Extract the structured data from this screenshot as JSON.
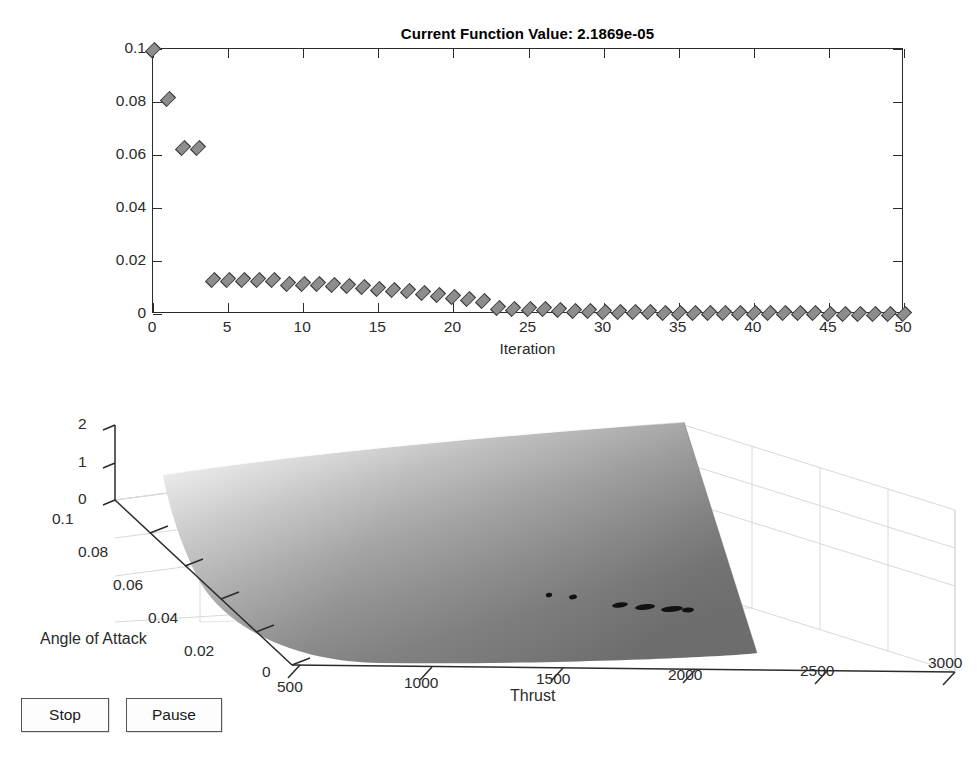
{
  "window": {
    "background": "#ffffff",
    "marker_fill": "#8d8d8d",
    "marker_edge": "#3a3a3a",
    "axis_color": "#2b2b2b"
  },
  "iteration_plot": {
    "title": "Current Function Value: 2.1869e-05",
    "xlabel": "Iteration",
    "ylabel": "Function value",
    "ytick_labels": [
      "0",
      "0.02",
      "0.04",
      "0.06",
      "0.08",
      "0.1"
    ],
    "xtick_labels": [
      "0",
      "5",
      "10",
      "15",
      "20",
      "25",
      "30",
      "35",
      "40",
      "45",
      "50"
    ]
  },
  "surface_plot": {
    "xlabel": "Thrust",
    "ylabel": "Angle of Attack",
    "ztick_labels": [
      "0",
      "1",
      "2"
    ],
    "ytick_labels": [
      "0.1",
      "0.08",
      "0.06",
      "0.04",
      "0.02",
      "0"
    ],
    "xtick_labels": [
      "500",
      "1000",
      "1500",
      "2000",
      "2500",
      "3000"
    ]
  },
  "controls": {
    "stop_label": "Stop",
    "pause_label": "Pause"
  },
  "chart_data": [
    {
      "type": "scatter",
      "title": "Current Function Value: 2.1869e-05",
      "xlabel": "Iteration",
      "ylabel": "Function value",
      "xlim": [
        0,
        50
      ],
      "ylim": [
        0,
        0.1
      ],
      "xticks": [
        0,
        5,
        10,
        15,
        20,
        25,
        30,
        35,
        40,
        45,
        50
      ],
      "yticks": [
        0,
        0.02,
        0.04,
        0.06,
        0.08,
        0.1
      ],
      "grid": false,
      "legend": null,
      "marker": "diamond",
      "series": [
        {
          "name": "Current Function Value",
          "x": [
            0,
            1,
            2,
            3,
            4,
            5,
            6,
            7,
            8,
            9,
            10,
            11,
            12,
            13,
            14,
            15,
            16,
            17,
            18,
            19,
            20,
            21,
            22,
            23,
            24,
            25,
            26,
            27,
            28,
            29,
            30,
            31,
            32,
            33,
            34,
            35,
            36,
            37,
            38,
            39,
            40,
            41,
            42,
            43,
            44,
            45,
            46,
            47,
            48,
            49,
            50
          ],
          "y": [
            0.0995,
            0.081,
            0.0625,
            0.0625,
            0.0128,
            0.0128,
            0.0128,
            0.0127,
            0.0127,
            0.0114,
            0.0113,
            0.0112,
            0.011,
            0.0104,
            0.0103,
            0.0094,
            0.0092,
            0.0085,
            0.0078,
            0.0071,
            0.0064,
            0.0058,
            0.005,
            0.0022,
            0.002,
            0.0019,
            0.0018,
            0.0016,
            0.0013,
            0.001,
            0.0008,
            0.0007,
            0.0006,
            0.0006,
            0.0005,
            0.0005,
            0.0004,
            0.0004,
            0.0003,
            0.0003,
            0.0003,
            0.0002,
            0.0002,
            0.0002,
            0.0002,
            0.0001,
            0.0001,
            0.0001,
            0.0001,
            5e-05,
            2.1869e-05
          ]
        }
      ]
    },
    {
      "type": "surface",
      "xlabel": "Thrust",
      "ylabel": "Angle of Attack",
      "zlabel": "",
      "xlim": [
        0,
        3000
      ],
      "ylim": [
        0,
        0.1
      ],
      "zlim": [
        0,
        2
      ],
      "xticks": [
        500,
        1000,
        1500,
        2000,
        2500,
        3000
      ],
      "yticks": [
        0,
        0.02,
        0.04,
        0.06,
        0.08,
        0.1
      ],
      "zticks": [
        0,
        1,
        2
      ],
      "grid": true,
      "shading": "grayscale-gradient-light-to-dark",
      "note": "Monotone surface rising toward low thrust / high angle of attack; optimization path markers plotted near thrust 1700-2200 on the low-z plateau."
    }
  ]
}
